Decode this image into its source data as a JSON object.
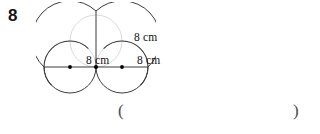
{
  "page": {
    "background_color": "#ffffff",
    "question_number": "8"
  },
  "figure": {
    "name": "two-lobed-heart-circles-diagram",
    "stroke_color": "#3a3a3a",
    "faint_stroke_color": "#c8c8c8",
    "dot_color": "#000000",
    "labels": [
      {
        "id": "top-right",
        "text": "8 cm"
      },
      {
        "id": "mid-left",
        "text": "8 cm"
      },
      {
        "id": "mid-right",
        "text": "8 cm"
      }
    ],
    "geometry": {
      "baseline_y": 65,
      "center_x": 60,
      "left_extent_x": 8,
      "right_extent_x": 112,
      "top_y": 9,
      "bottom_y": 91,
      "dots": [
        {
          "x": 34,
          "y": 65
        },
        {
          "x": 60,
          "y": 65
        },
        {
          "x": 86,
          "y": 65
        }
      ]
    }
  },
  "answer": {
    "open_paren": "(",
    "close_paren": ")"
  }
}
